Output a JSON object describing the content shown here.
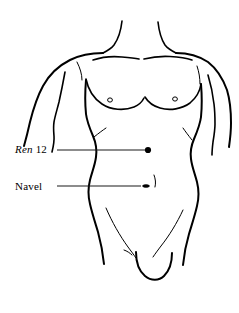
{
  "figure": {
    "type": "anatomical-line-drawing",
    "background_color": "#ffffff",
    "line_color": "#000000"
  },
  "labels": {
    "ren12": {
      "channel": "Ren",
      "number": "12",
      "full": "Ren 12",
      "leader": {
        "x1": 57,
        "y1": 150,
        "x2": 145,
        "y2": 150
      },
      "point": {
        "x": 148,
        "y": 150,
        "radius": 3.1,
        "color": "#000000"
      }
    },
    "navel": {
      "text": "Navel",
      "leader": {
        "x1": 57,
        "y1": 186,
        "x2": 140,
        "y2": 186
      },
      "marker": {
        "x": 147,
        "y": 186
      }
    }
  },
  "anatomy": {
    "nipple_left": {
      "x": 110,
      "y": 100
    },
    "nipple_right": {
      "x": 175,
      "y": 99
    },
    "navel_position": {
      "x": 147,
      "y": 186
    }
  }
}
